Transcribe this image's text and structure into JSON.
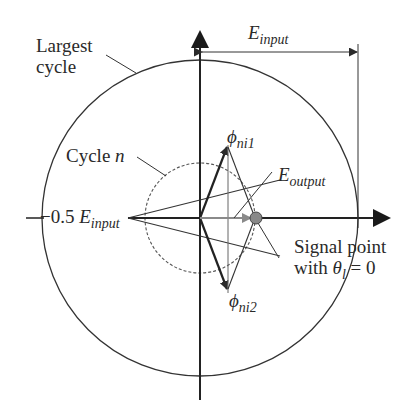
{
  "diagram": {
    "labels": {
      "largest_cycle_line1": "Largest",
      "largest_cycle_line2": "cycle",
      "cycle_n": "Cycle",
      "cycle_n_var": "n",
      "e_input_top": "E",
      "e_input_top_sub": "input",
      "neg_half_prefix": "−0.5 ",
      "neg_half_E": "E",
      "neg_half_sub": "input",
      "phi1": "ϕ",
      "phi1_sub": "ni1",
      "phi2": "ϕ",
      "phi2_sub": "ni2",
      "e_output": "E",
      "e_output_sub": "output",
      "signal_line1": "Signal point",
      "signal_line2_prefix": "with ",
      "signal_theta": "θ",
      "signal_theta_sub": "l",
      "signal_suffix": " = 0"
    },
    "colors": {
      "ink": "#2a2a2a",
      "gray_vector": "#8a8a8a",
      "signal_point": "#888888"
    }
  }
}
